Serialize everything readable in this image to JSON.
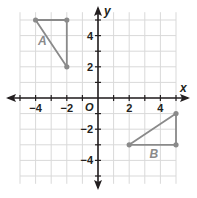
{
  "diagram": {
    "type": "coordinate-plane",
    "axes": {
      "x_label": "x",
      "y_label": "y",
      "origin_label": "O",
      "x_ticks": [
        {
          "value": -4,
          "label": "−4"
        },
        {
          "value": -2,
          "label": "−2"
        },
        {
          "value": 2,
          "label": "2"
        },
        {
          "value": 4,
          "label": "4"
        }
      ],
      "y_ticks": [
        {
          "value": 4,
          "label": "4"
        },
        {
          "value": 2,
          "label": "2"
        },
        {
          "value": -2,
          "label": "−2"
        },
        {
          "value": -4,
          "label": "−4"
        }
      ],
      "range": {
        "x": [
          -5,
          5
        ],
        "y": [
          -5,
          5
        ]
      }
    },
    "shapes": [
      {
        "name": "A",
        "label": "A",
        "vertices": [
          [
            -4,
            5
          ],
          [
            -2,
            5
          ],
          [
            -2,
            2
          ]
        ],
        "color": "#8a8a8a"
      },
      {
        "name": "B",
        "label": "B",
        "vertices": [
          [
            2,
            -3
          ],
          [
            5,
            -1
          ],
          [
            5,
            -3
          ]
        ],
        "color": "#8a8a8a"
      }
    ],
    "colors": {
      "grid": "#d9d9d9",
      "axis": "#231f20",
      "shape": "#8a8a8a"
    }
  }
}
